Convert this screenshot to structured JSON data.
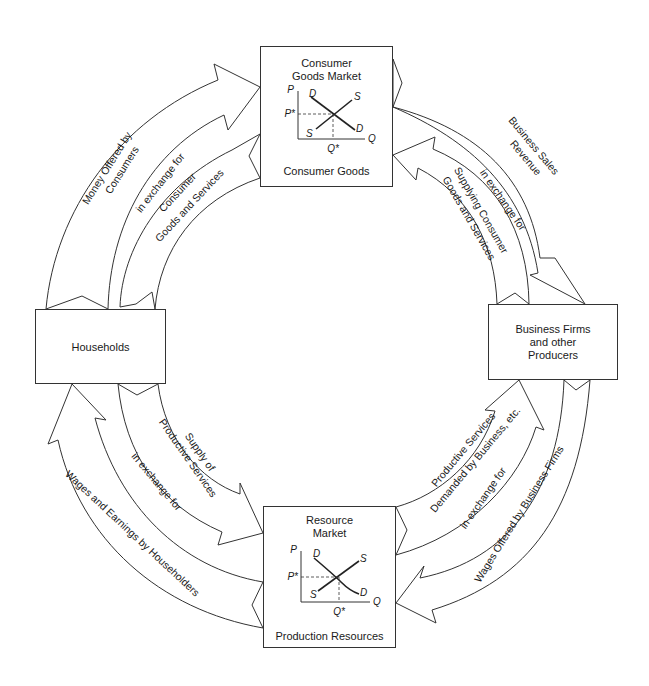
{
  "diagram": {
    "type": "circular-flow",
    "nodes": {
      "consumer_goods_market": {
        "title_line1": "Consumer",
        "title_line2": "Goods Market",
        "caption": "Consumer Goods",
        "chart": {
          "p_axis": "P",
          "q_axis": "Q",
          "demand": "D",
          "supply": "S",
          "p_eq": "P*",
          "q_eq": "Q*"
        }
      },
      "resource_market": {
        "title_line1": "Resource",
        "title_line2": "Market",
        "caption": "Production Resources",
        "chart": {
          "p_axis": "P",
          "q_axis": "Q",
          "demand": "D",
          "supply": "S",
          "p_eq": "P*",
          "q_eq": "Q*"
        }
      },
      "households": {
        "label": "Households"
      },
      "business_firms": {
        "line1": "Business Firms",
        "line2": "and other",
        "line3": "Producers"
      }
    },
    "flows": {
      "upper_left": {
        "outer_line1": "Money Offered by",
        "outer_line2": "Consumers",
        "middle": "in exchange for",
        "inner_line1": "Consumer",
        "inner_line2": "Goods and Services"
      },
      "upper_right": {
        "outer_line1": "Business Sales",
        "outer_line2": "Revenue",
        "middle": "in exchange for",
        "inner_line1": "Supplying Consumer",
        "inner_line2": "Goods and Services"
      },
      "lower_left": {
        "inner_line1": "Supply of",
        "inner_line2": "Productive Services",
        "middle": "in exchange for",
        "outer": "Wages and Earnings by Householders"
      },
      "lower_right": {
        "inner_line1": "Productive Services",
        "inner_line2": "Demanded by Business, etc.",
        "middle": "in exchange for",
        "outer": "Wages Offered by Business Firms"
      }
    }
  },
  "colors": {
    "stroke": "#333333",
    "background": "#ffffff",
    "text": "#1a1a1a"
  }
}
